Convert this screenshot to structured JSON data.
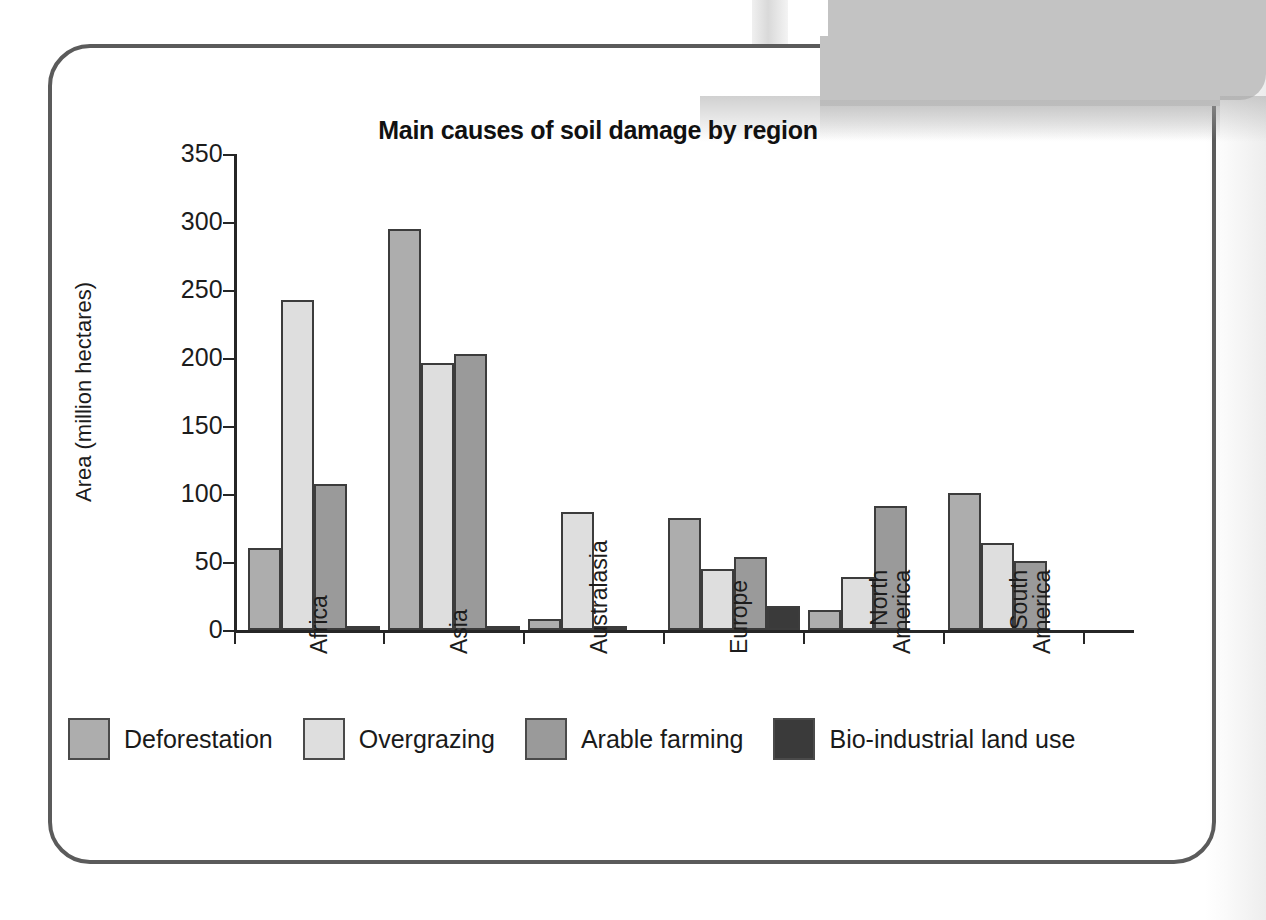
{
  "chart_data": {
    "type": "bar",
    "title": "Main causes of soil damage by region",
    "xlabel": "",
    "ylabel": "Area (million hectares)",
    "ylim": [
      0,
      350
    ],
    "yticks": [
      0,
      50,
      100,
      150,
      200,
      250,
      300,
      350
    ],
    "grid": false,
    "legend_position": "bottom-left",
    "categories": [
      "Africa",
      "Asia",
      "Australasia",
      "Europe",
      "North\nAmerica",
      "South\nAmerica"
    ],
    "category_labels": [
      "Africa",
      "Asia",
      "Australasia",
      "North America",
      "South America",
      "Europe"
    ],
    "series": [
      {
        "name": "Deforestation",
        "color": "#adadad",
        "values": [
          60,
          295,
          8,
          82,
          15,
          101
        ]
      },
      {
        "name": "Overgrazing",
        "color": "#dedede",
        "values": [
          243,
          196,
          87,
          45,
          39,
          64
        ]
      },
      {
        "name": "Arable farming",
        "color": "#9a9a9a",
        "values": [
          107,
          203,
          3,
          54,
          91,
          51
        ]
      },
      {
        "name": "Bio-industrial land use",
        "color": "#3a3a3a",
        "values": [
          2,
          2,
          0,
          18,
          0,
          0
        ]
      }
    ]
  },
  "legend": {
    "items": [
      {
        "label": "Deforestation",
        "color": "#adadad"
      },
      {
        "label": "Overgrazing",
        "color": "#dedede"
      },
      {
        "label": "Arable farming",
        "color": "#9a9a9a"
      },
      {
        "label": "Bio-industrial land use",
        "color": "#3a3a3a"
      }
    ]
  },
  "colors": {
    "frame_border": "#5b5b5b",
    "axis": "#262626",
    "text": "#1a1a1a",
    "page_background": "#ffffff",
    "book_panel": "#c3c3c3"
  }
}
